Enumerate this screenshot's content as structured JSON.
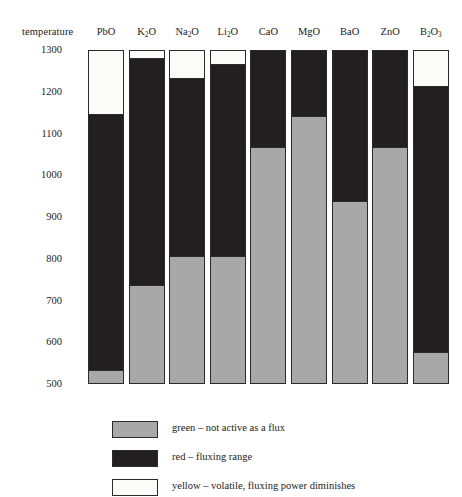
{
  "chart_data": {
    "type": "bar",
    "title": "",
    "subtitle": "",
    "xlabel": "",
    "ylabel": "temperature",
    "ylim": [
      500,
      1300
    ],
    "yticks": [
      1300,
      1200,
      1100,
      1000,
      900,
      800,
      700,
      600,
      500
    ],
    "ytick_labels": [
      "1300",
      "1200",
      "1100",
      "1000",
      "900",
      "800",
      "700",
      "600",
      "500"
    ],
    "grid": false,
    "legend_position": "bottom-left",
    "stacked": true,
    "categories": [
      "PbO",
      "K2O",
      "Na2O",
      "Li2O",
      "CaO",
      "MgO",
      "BaO",
      "ZnO",
      "B2O3"
    ],
    "category_labels_html": [
      "PbO",
      "K<sub>2</sub>O",
      "Na<sub>2</sub>O",
      "Li<sub>2</sub>O",
      "CaO",
      "MgO",
      "BaO",
      "ZnO",
      "B<sub>2</sub>O<sub>3</sub>"
    ],
    "series": [
      {
        "name": "green",
        "key": "green",
        "description": "not active as a flux",
        "color": "#a8a8a8",
        "ranges": [
          {
            "category": "PbO",
            "from": 500,
            "to": 535
          },
          {
            "category": "K2O",
            "from": 500,
            "to": 740
          },
          {
            "category": "Na2O",
            "from": 500,
            "to": 810
          },
          {
            "category": "Li2O",
            "from": 500,
            "to": 810
          },
          {
            "category": "CaO",
            "from": 500,
            "to": 1070
          },
          {
            "category": "MgO",
            "from": 500,
            "to": 1145
          },
          {
            "category": "BaO",
            "from": 500,
            "to": 940
          },
          {
            "category": "ZnO",
            "from": 500,
            "to": 1070
          },
          {
            "category": "B2O3",
            "from": 500,
            "to": 580
          }
        ]
      },
      {
        "name": "red",
        "key": "red",
        "description": "fluxing range",
        "color": "#231f20",
        "ranges": [
          {
            "category": "PbO",
            "from": 535,
            "to": 1150
          },
          {
            "category": "K2O",
            "from": 740,
            "to": 1283
          },
          {
            "category": "Na2O",
            "from": 810,
            "to": 1235
          },
          {
            "category": "Li2O",
            "from": 810,
            "to": 1270
          },
          {
            "category": "CaO",
            "from": 1070,
            "to": 1300
          },
          {
            "category": "MgO",
            "from": 1145,
            "to": 1300
          },
          {
            "category": "BaO",
            "from": 940,
            "to": 1300
          },
          {
            "category": "ZnO",
            "from": 1070,
            "to": 1300
          },
          {
            "category": "B2O3",
            "from": 580,
            "to": 1215
          }
        ]
      },
      {
        "name": "yellow",
        "key": "yellow",
        "description": "volatile, fluxing power diminishes",
        "color": "#fbfbf8",
        "ranges": [
          {
            "category": "PbO",
            "from": 1150,
            "to": 1300
          },
          {
            "category": "K2O",
            "from": 1283,
            "to": 1300
          },
          {
            "category": "Na2O",
            "from": 1235,
            "to": 1300
          },
          {
            "category": "Li2O",
            "from": 1270,
            "to": 1300
          },
          {
            "category": "B2O3",
            "from": 1215,
            "to": 1300
          }
        ]
      }
    ]
  },
  "legend": {
    "items": [
      {
        "swatch": "green",
        "label": "green – not active as a flux"
      },
      {
        "swatch": "red",
        "label": "red – fluxing range"
      },
      {
        "swatch": "yellow",
        "label": "yellow – volatile, fluxing power diminishes"
      }
    ]
  }
}
